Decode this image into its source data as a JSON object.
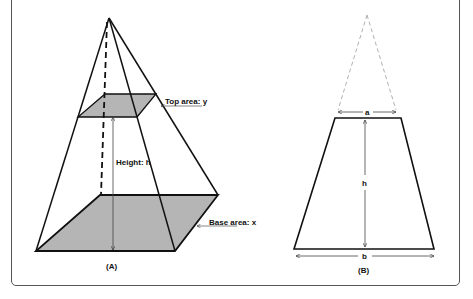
{
  "figure": {
    "panel_a": {
      "caption": "(A)",
      "labels": {
        "top_area": "Top area: y",
        "height": "Height: h",
        "base_area": "Base area: x"
      }
    },
    "panel_b": {
      "caption": "(B)",
      "labels": {
        "top_width": "a",
        "height": "h",
        "bottom_width": "b"
      }
    }
  },
  "colors": {
    "stroke": "#111111",
    "fill": "#b5b5b5",
    "dashed_ghost": "#b0b0b0",
    "frame": "#555555"
  }
}
